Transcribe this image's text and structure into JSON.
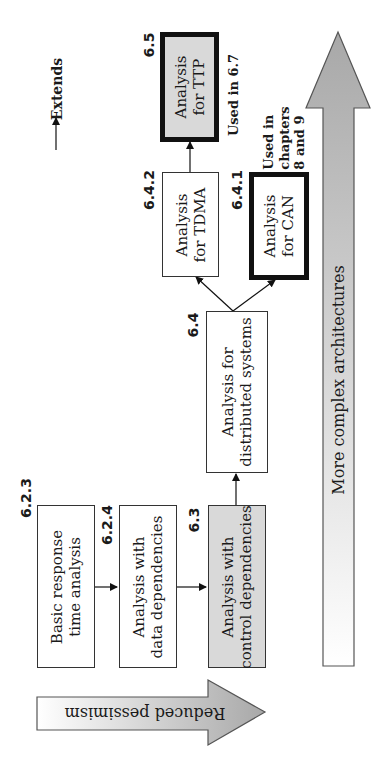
{
  "legend": {
    "arrow_label": "Extends"
  },
  "boxes": {
    "b623": {
      "id": "6.2.3",
      "line1": "Basic response",
      "line2": "time analysis"
    },
    "b624": {
      "id": "6.2.4",
      "line1": "Analysis with",
      "line2": "data dependencies"
    },
    "b63": {
      "id": "6.3",
      "line1": "Analysis with",
      "line2": "control dependencies"
    },
    "b64": {
      "id": "6.4",
      "line1": "Analysis for",
      "line2": "distributed systems"
    },
    "b642": {
      "id": "6.4.2",
      "line1": "Analysis",
      "line2": "for TDMA"
    },
    "b641": {
      "id": "6.4.1",
      "line1": "Analysis",
      "line2": "for CAN"
    },
    "b65": {
      "id": "6.5",
      "line1": "Analysis",
      "line2": "for TTP"
    }
  },
  "notes": {
    "ttp_used": "Used in 6.7",
    "can_used_1": "Used in",
    "can_used_2": "chapters",
    "can_used_3": "8 and 9"
  },
  "axes": {
    "vertical_arrow_label": "More complex architectures",
    "horizontal_arrow_label": "Reduced pessimism"
  },
  "colors": {
    "gray_fill": "#d9d9d9",
    "arrow_gradient_light": "#f2f2f2",
    "arrow_gradient_dark": "#a8a8a8",
    "border": "#333333"
  }
}
